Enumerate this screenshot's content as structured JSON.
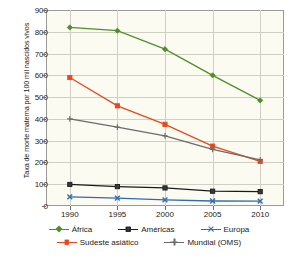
{
  "chart_data": {
    "type": "line",
    "title": "",
    "xlabel": "",
    "ylabel": "Taxa de morte materna por 100 mil nascidos vivos",
    "x": [
      1990,
      1995,
      2000,
      2005,
      2010
    ],
    "categories": [
      "1990",
      "1995",
      "2000",
      "2005",
      "2010"
    ],
    "xtick_labels": [
      "1990",
      "1995",
      "2000",
      "2005",
      "2010"
    ],
    "ytick_labels": [
      "0",
      "100",
      "200",
      "300",
      "400",
      "500",
      "600",
      "700",
      "800",
      "900"
    ],
    "ytick_values": [
      0,
      100,
      200,
      300,
      400,
      500,
      600,
      700,
      800,
      900
    ],
    "ylim": [
      0,
      900
    ],
    "grid": "horizontal-and-vertical",
    "legend_position": "bottom",
    "plot_background": "#fbfbf2",
    "grid_color": "#cfcfc4",
    "series": [
      {
        "name": "África",
        "color": "#4f8f29",
        "marker": "diamond",
        "values": [
          820,
          805,
          720,
          600,
          485
        ]
      },
      {
        "name": "Sudeste asiático",
        "color": "#e8491c",
        "marker": "square",
        "values": [
          590,
          460,
          375,
          275,
          205
        ]
      },
      {
        "name": "Mundial (OMS)",
        "color": "#6b6b6b",
        "marker": "plus",
        "values": [
          400,
          362,
          322,
          260,
          212
        ]
      },
      {
        "name": "Américas",
        "color": "#1a1a1a",
        "marker": "square",
        "values": [
          99,
          89,
          83,
          68,
          66
        ]
      },
      {
        "name": "Europa",
        "color": "#2f6bb5",
        "marker": "x",
        "values": [
          42,
          36,
          28,
          23,
          22
        ]
      }
    ]
  },
  "legend": {
    "row1": [
      {
        "label": "África",
        "color": "#4f8f29",
        "marker": "diamond"
      },
      {
        "label": "Américas",
        "color": "#1a1a1a",
        "marker": "square"
      },
      {
        "label": "Europa",
        "color": "#2f6bb5",
        "marker": "x"
      }
    ],
    "row2": [
      {
        "label": "Sudeste asiático",
        "color": "#e8491c",
        "marker": "square"
      },
      {
        "label": "Mundial (OMS)",
        "color": "#6b6b6b",
        "marker": "plus"
      }
    ]
  }
}
